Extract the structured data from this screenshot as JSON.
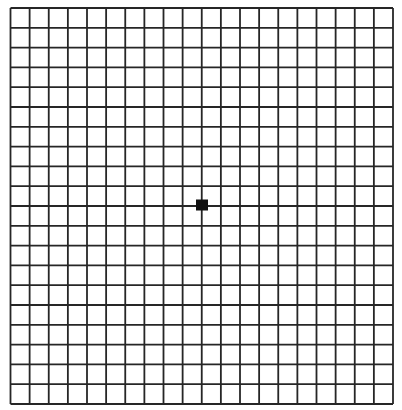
{
  "grid": {
    "name": "Amsler grid",
    "rows": 20,
    "cols": 20,
    "left": 10.5,
    "top": 8,
    "right": 393,
    "bottom": 404,
    "line_color": "#262626",
    "line_width": 1.8,
    "background": "#ffffff"
  },
  "center_dot": {
    "shape": "square",
    "cx": 202,
    "cy": 205,
    "width": 12,
    "height": 11,
    "color": "#111111"
  }
}
